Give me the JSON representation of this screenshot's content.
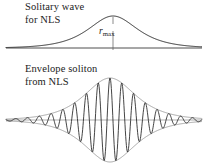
{
  "figure": {
    "background": "#ffffff",
    "ink": "#1b1b1b"
  },
  "top_panel": {
    "caption_line1": "Solitary wave",
    "caption_line2": "for NLS",
    "peak_symbol": "r",
    "peak_subscript": "max"
  },
  "bottom_panel": {
    "caption_line1": "Envelope soliton",
    "caption_line2": "from NLS"
  },
  "chart_data": [
    {
      "type": "line",
      "title": "Solitary wave for NLS",
      "description": "Single hyperbolic-secant bump above a horizontal axis, peak amplitude annotated r_max with a vertical tick dropped from the crest to the axis.",
      "xlabel": "",
      "ylabel": "",
      "grid": false,
      "legend": false,
      "annotations": [
        "r_max"
      ],
      "axis_baseline_y": 48,
      "axis_x_range": [
        6,
        202
      ],
      "series": [
        {
          "name": "sech envelope",
          "function": "A*sech(x/w)",
          "amplitude": 32,
          "width": 22,
          "center_x": 113,
          "peak_y": 16
        }
      ]
    },
    {
      "type": "line",
      "title": "Envelope soliton from NLS",
      "description": "Fast oscillatory carrier wave modulated by a symmetric sech envelope drawn as faint upper and lower bounding curves about a horizontal axis.",
      "xlabel": "",
      "ylabel": "",
      "grid": false,
      "legend": false,
      "annotations": [],
      "axis_baseline_y": 120,
      "axis_x_range": [
        6,
        202
      ],
      "series": [
        {
          "name": "upper envelope",
          "function": "+A*sech(x/w)",
          "amplitude": 42,
          "width": 23,
          "center_x": 110
        },
        {
          "name": "lower envelope",
          "function": "-A*sech(x/w)",
          "amplitude": 42,
          "width": 23,
          "center_x": 110
        },
        {
          "name": "carrier",
          "function": "A*sech(x/w)*cos(k*(x-x0))",
          "amplitude": 42,
          "width": 23,
          "center_x": 110,
          "wavelength": 11.8,
          "visible_oscillation_count": 17
        }
      ]
    }
  ]
}
